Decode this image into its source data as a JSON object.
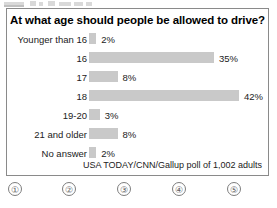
{
  "chart_data": {
    "type": "bar",
    "orientation": "horizontal",
    "title": "At what age should people be allowed to drive?",
    "categories": [
      "Younger than 16",
      "16",
      "17",
      "18",
      "19-20",
      "21 and older",
      "No answer"
    ],
    "values": [
      2,
      35,
      8,
      42,
      3,
      8,
      2
    ],
    "value_labels": [
      "2%",
      "35%",
      "8%",
      "42%",
      "3%",
      "8%",
      "2%"
    ],
    "xlabel": "",
    "ylabel": "",
    "xlim": [
      0,
      42
    ],
    "grid": false,
    "legend": false,
    "bar_color": "#c9c9c9",
    "source": "USA TODAY/CNN/Gallup poll of 1,002 adults"
  },
  "panel": {
    "title": "At what age should people be allowed to drive?",
    "source": "USA TODAY/CNN/Gallup poll of 1,002 adults"
  },
  "rows": [
    {
      "label": "Younger than 16",
      "value": "2%",
      "pct": 2
    },
    {
      "label": "16",
      "value": "35%",
      "pct": 35
    },
    {
      "label": "17",
      "value": "8%",
      "pct": 8
    },
    {
      "label": "18",
      "value": "42%",
      "pct": 42
    },
    {
      "label": "19-20",
      "value": "3%",
      "pct": 3
    },
    {
      "label": "21 and older",
      "value": "8%",
      "pct": 8
    },
    {
      "label": "No answer",
      "value": "2%",
      "pct": 2
    }
  ],
  "footer": {
    "marks": [
      "①",
      "②",
      "③",
      "④",
      "⑤"
    ]
  }
}
